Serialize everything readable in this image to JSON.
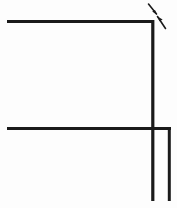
{
  "figure": {
    "title": "",
    "type": "line-drawing",
    "background_color": "#fdfdfd",
    "stroke_color": "#1a1a1a",
    "canvas": {
      "width": 177,
      "height": 208
    },
    "description": "Technical line drawing of two nested right-angle corner profiles with two diagonal leader arrow marks at the upper right corner.",
    "labels": [],
    "annotations": [
      {
        "name": "upper-leader-arrow",
        "direction": "down-right",
        "text": ""
      },
      {
        "name": "lower-leader-arrow",
        "direction": "down-right",
        "text": ""
      }
    ],
    "strokes": [
      {
        "name": "outer-top-horizontal-line",
        "x1": 7,
        "y1": 21.5,
        "x2": 154,
        "y2": 21.5,
        "width": 3.2
      },
      {
        "name": "outer-right-vertical-line",
        "x1": 152.8,
        "y1": 20,
        "x2": 152.8,
        "y2": 201,
        "width": 3.2
      },
      {
        "name": "inner-middle-horizontal-line",
        "x1": 7,
        "y1": 128.5,
        "x2": 171,
        "y2": 128.5,
        "width": 3.0
      },
      {
        "name": "inner-right-vertical-line",
        "x1": 169.3,
        "y1": 127,
        "x2": 169.3,
        "y2": 201,
        "width": 3.0
      }
    ],
    "arrow_strokes": [
      {
        "name": "upper-leader-arrow-shaft",
        "x1": 148.5,
        "y1": 4.0,
        "x2": 156.5,
        "y2": 14.0,
        "width": 1.6
      },
      {
        "name": "lower-leader-arrow-shaft",
        "x1": 157.5,
        "y1": 16.5,
        "x2": 165.5,
        "y2": 28.5,
        "width": 1.6
      }
    ],
    "arrow_heads": [
      {
        "name": "upper-leader-arrow-head",
        "points": "157.2,15.1 152.2,11.6 155.0,10.1"
      },
      {
        "name": "lower-leader-arrow-head",
        "points": "157.1,16.2 162.6,19.4 159.6,21.3"
      }
    ]
  }
}
